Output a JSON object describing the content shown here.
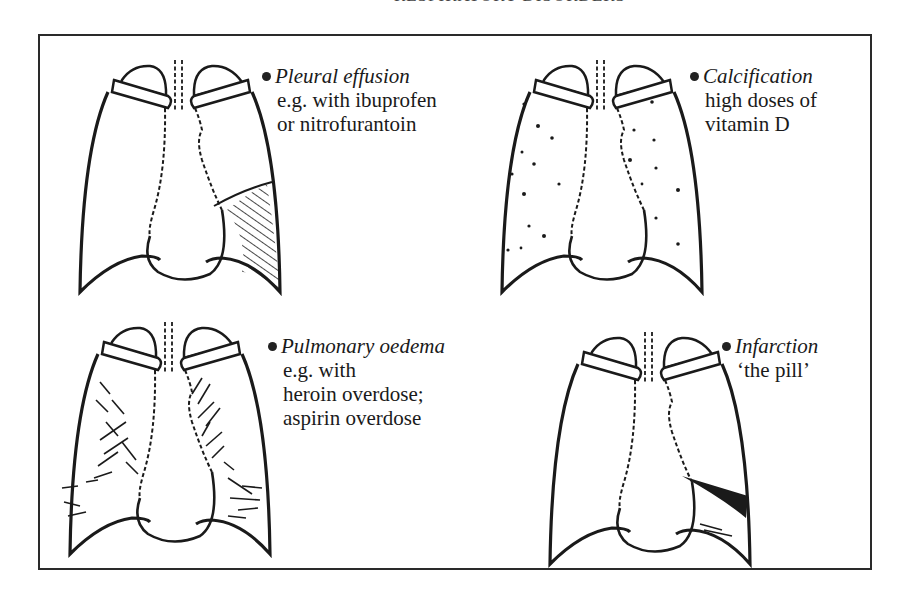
{
  "header": {
    "text": "RESPIRATORY DISORDERS"
  },
  "panels": [
    {
      "id": "pleural-effusion",
      "title": "Pleural effusion",
      "lines": [
        "e.g. with ibuprofen",
        "or nitrofurantoin"
      ]
    },
    {
      "id": "calcification",
      "title": "Calcification",
      "lines": [
        "high doses of",
        "vitamin D"
      ]
    },
    {
      "id": "pulmonary-oedema",
      "title": "Pulmonary oedema",
      "lines": [
        "e.g. with",
        "heroin overdose;",
        "aspirin overdose"
      ]
    },
    {
      "id": "infarction",
      "title": "Infarction",
      "lines": [
        "‘the pill’"
      ]
    }
  ],
  "colors": {
    "ink": "#1a1a1a",
    "frame": "#2a2a2a",
    "background": "#ffffff"
  }
}
